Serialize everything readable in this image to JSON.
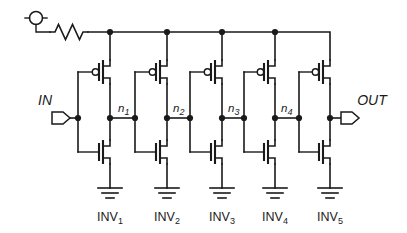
{
  "figure": {
    "background_color": "#ffffff",
    "line_color": "#1a1a1a"
  },
  "ports": {
    "input": {
      "label": "IN",
      "name": "input-port"
    },
    "output": {
      "label": "OUT",
      "name": "output-port"
    }
  },
  "supply": {
    "symbol_name": "supply-terminal",
    "resistor_name": "series-resistor"
  },
  "nodes": [
    {
      "label": "n",
      "sub": "1"
    },
    {
      "label": "n",
      "sub": "2"
    },
    {
      "label": "n",
      "sub": "3"
    },
    {
      "label": "n",
      "sub": "4"
    }
  ],
  "stages": [
    {
      "label": "INV",
      "sub": "1"
    },
    {
      "label": "INV",
      "sub": "2"
    },
    {
      "label": "INV",
      "sub": "3"
    },
    {
      "label": "INV",
      "sub": "4"
    },
    {
      "label": "INV",
      "sub": "5"
    }
  ],
  "devices": {
    "pmos_name": "pmos-transistor",
    "nmos_name": "nmos-transistor",
    "ground_name": "ground-symbol",
    "rail_name": "supply-rail"
  }
}
